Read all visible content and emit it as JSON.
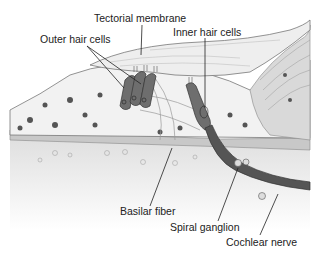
{
  "diagram": {
    "labels": {
      "tectorial_membrane": "Tectorial membrane",
      "outer_hair_cells": "Outer hair cells",
      "inner_hair_cells": "Inner hair cells",
      "basilar_fiber": "Basilar fiber",
      "spiral_ganglion": "Spiral ganglion",
      "cochlear_nerve": "Cochlear nerve"
    },
    "colors": {
      "hair_cell_fill": "#6e6e6e",
      "tissue_fill": "#f2f2f2",
      "outline": "#555555",
      "nucleus": "#555555",
      "background": "#ffffff"
    }
  }
}
